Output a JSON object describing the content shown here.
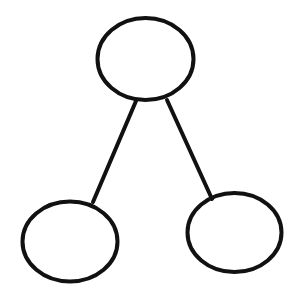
{
  "diagram": {
    "type": "tree",
    "background": "#ffffff",
    "stroke_color": "#111111",
    "stroke_width": 4,
    "nodes": [
      {
        "id": "root",
        "label": "",
        "cx": 145.5,
        "cy": 59,
        "rx": 48,
        "ry": 41
      },
      {
        "id": "left-child",
        "label": "",
        "cx": 70,
        "cy": 241.5,
        "rx": 47.5,
        "ry": 40
      },
      {
        "id": "right-child",
        "label": "",
        "cx": 234.5,
        "cy": 232.5,
        "rx": 47,
        "ry": 39.5
      }
    ],
    "edges": [
      {
        "from": "root",
        "to": "left-child",
        "x1": 136,
        "y1": 101,
        "x2": 93,
        "y2": 202
      },
      {
        "from": "root",
        "to": "right-child",
        "x1": 167,
        "y1": 100,
        "x2": 212,
        "y2": 199
      }
    ]
  }
}
